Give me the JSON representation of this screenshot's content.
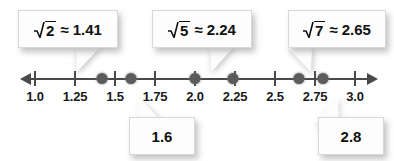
{
  "diagram": {
    "number_line": {
      "min": 1.0,
      "max": 3.0,
      "left_arrow_icon": "arrow-left",
      "right_arrow_icon": "arrow-right",
      "ticks": [
        {
          "value": 1.0,
          "label": "1.0"
        },
        {
          "value": 1.25,
          "label": "1.25"
        },
        {
          "value": 1.5,
          "label": "1.5"
        },
        {
          "value": 1.75,
          "label": "1.75"
        },
        {
          "value": 2.0,
          "label": "2.0"
        },
        {
          "value": 2.25,
          "label": "2.25"
        },
        {
          "value": 2.5,
          "label": "2.5"
        },
        {
          "value": 2.75,
          "label": "2.75"
        },
        {
          "value": 3.0,
          "label": "3.0"
        }
      ],
      "points": [
        {
          "value": 1.41,
          "name": "point-sqrt2"
        },
        {
          "value": 1.6,
          "name": "point-1-6"
        },
        {
          "value": 2.0,
          "name": "point-2-0"
        },
        {
          "value": 2.24,
          "name": "point-sqrt5"
        },
        {
          "value": 2.65,
          "name": "point-sqrt7"
        },
        {
          "value": 2.8,
          "name": "point-2-8"
        }
      ]
    },
    "callouts": [
      {
        "id": "callout-sqrt2",
        "radicand": "2",
        "relation": "≈",
        "approximation": "1.41",
        "full_text": "√2 ≈ 1.41",
        "points_to": 1.41,
        "position": "top"
      },
      {
        "id": "callout-sqrt5",
        "radicand": "5",
        "relation": "≈",
        "approximation": "2.24",
        "full_text": "√5 ≈ 2.24",
        "points_to": 2.24,
        "position": "top"
      },
      {
        "id": "callout-sqrt7",
        "radicand": "7",
        "relation": "≈",
        "approximation": "2.65",
        "full_text": "√7 ≈ 2.65",
        "points_to": 2.65,
        "position": "top"
      },
      {
        "id": "callout-1-6",
        "full_text": "1.6",
        "points_to": 1.6,
        "position": "bottom"
      },
      {
        "id": "callout-2-8",
        "full_text": "2.8",
        "points_to": 2.8,
        "position": "bottom"
      }
    ],
    "colors": {
      "line": "#4a4a4a",
      "point": "#5b5b5b",
      "bubble_fill": "#fdfdfd",
      "bubble_border": "#d8d8d8",
      "text": "#111111",
      "background": "#ffffff"
    }
  }
}
